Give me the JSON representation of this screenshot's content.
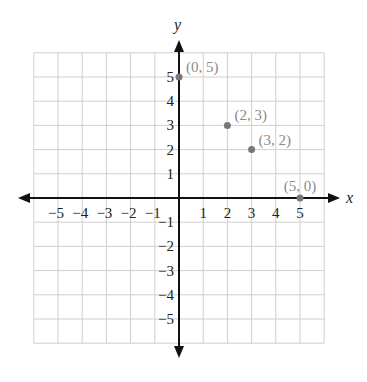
{
  "chart_data": {
    "type": "scatter",
    "title": "",
    "xlabel": "x",
    "ylabel": "y",
    "xlim": [
      -6,
      6
    ],
    "ylim": [
      -6,
      6
    ],
    "grid": true,
    "x_ticks": [
      "-5",
      "-4",
      "-3",
      "-2",
      "-1",
      "1",
      "2",
      "3",
      "4",
      "5"
    ],
    "y_ticks": [
      "5",
      "4",
      "3",
      "2",
      "1",
      "-1",
      "-2",
      "-3",
      "-4",
      "-5"
    ],
    "points": [
      {
        "x": 0,
        "y": 5,
        "label": "(0, 5)"
      },
      {
        "x": 2,
        "y": 3,
        "label": "(2, 3)"
      },
      {
        "x": 3,
        "y": 2,
        "label": "(3, 2)"
      },
      {
        "x": 5,
        "y": 0,
        "label": "(5, 0)"
      }
    ],
    "colors": {
      "axis": "#111111",
      "grid": "#cfcfcf",
      "point": "#777777",
      "label": "#8a8a8a"
    }
  }
}
